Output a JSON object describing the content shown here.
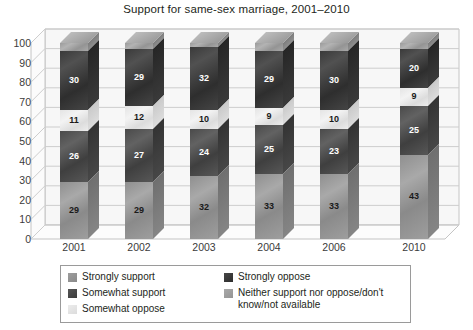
{
  "chart_data": {
    "type": "bar",
    "title": "Support for same-sex marriage, 2001–2010",
    "subtitle": "",
    "xlabel": "",
    "ylabel": "",
    "ylim": [
      0,
      100
    ],
    "yticks": [
      0,
      10,
      20,
      30,
      40,
      50,
      60,
      70,
      80,
      90,
      100
    ],
    "grid": true,
    "stacked": true,
    "three_d": true,
    "legend_position": "bottom",
    "categories": [
      "2001",
      "2002",
      "2003",
      "2004",
      "2006",
      "2010"
    ],
    "series": [
      {
        "name": "Strongly support",
        "key": "strongly-support",
        "color": "#9d9d9d",
        "values": [
          29,
          29,
          32,
          33,
          33,
          43
        ]
      },
      {
        "name": "Somewhat support",
        "key": "somewhat-support",
        "color": "#3c3c3c",
        "values": [
          26,
          27,
          24,
          25,
          23,
          25
        ]
      },
      {
        "name": "Somewhat oppose",
        "key": "somewhat-oppose",
        "color": "#e4e4e4",
        "values": [
          11,
          12,
          10,
          9,
          10,
          9
        ]
      },
      {
        "name": "Strongly oppose",
        "key": "strongly-oppose",
        "color": "#2d2d2d",
        "values": [
          30,
          29,
          32,
          29,
          30,
          20
        ]
      },
      {
        "name": "Neither support nor oppose/don't know/not available",
        "key": "neither",
        "color": "#a9a9a9",
        "values": [
          4,
          3,
          2,
          4,
          4,
          3
        ],
        "labels_shown": false
      }
    ]
  },
  "legend": {
    "items": [
      {
        "label": "Strongly support",
        "key": "strongly-support"
      },
      {
        "label": "Strongly oppose",
        "key": "strongly-oppose"
      },
      {
        "label": "Somewhat support",
        "key": "somewhat-support"
      },
      {
        "label": "Neither support nor oppose/don't know/not available",
        "key": "neither"
      },
      {
        "label": "Somewhat oppose",
        "key": "somewhat-oppose"
      }
    ]
  }
}
